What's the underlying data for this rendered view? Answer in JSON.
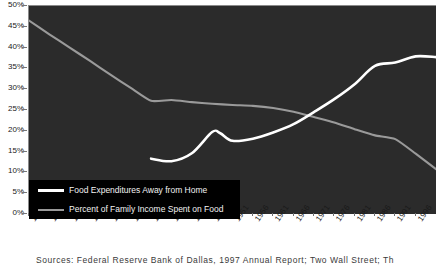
{
  "chart_data": {
    "type": "line",
    "title": "",
    "xlabel": "",
    "ylabel": "",
    "xlim": [
      1901,
      2001
    ],
    "ylim": [
      0,
      50
    ],
    "grid": false,
    "legend_position": "lower-left-inside",
    "y_tick_labels": [
      "50%",
      "45%",
      "40%",
      "35%",
      "30%",
      "25%",
      "20%",
      "15%",
      "10%",
      "5%",
      "0%"
    ],
    "y_tick_values": [
      50,
      45,
      40,
      35,
      30,
      25,
      20,
      15,
      10,
      5,
      0
    ],
    "x_tick_labels": [
      "1901",
      "1906",
      "1911",
      "1916",
      "1921",
      "1926",
      "1931",
      "1936",
      "1941",
      "1946",
      "1951",
      "1956",
      "1961",
      "1966",
      "1971",
      "1976",
      "1981",
      "1986",
      "1991",
      "1996"
    ],
    "x_tick_values": [
      1901,
      1906,
      1911,
      1916,
      1921,
      1926,
      1931,
      1936,
      1941,
      1946,
      1951,
      1956,
      1961,
      1966,
      1971,
      1976,
      1981,
      1986,
      1991,
      1996
    ],
    "series": [
      {
        "name": "Food Expenditures Away from Home",
        "color": "#ffffff",
        "x": [
          1931,
          1936,
          1941,
          1946,
          1948,
          1951,
          1956,
          1961,
          1966,
          1971,
          1976,
          1981,
          1986,
          1991,
          1996,
          2001
        ],
        "values": [
          13.3,
          12.7,
          14.6,
          19.7,
          19.4,
          17.6,
          18.1,
          19.6,
          21.6,
          24.5,
          27.6,
          31.2,
          35.6,
          36.4,
          37.9,
          37.7
        ]
      },
      {
        "name": "Percent of Family Income Spent on Food",
        "color": "#9a9a9a",
        "x": [
          1901,
          1906,
          1911,
          1916,
          1921,
          1926,
          1931,
          1936,
          1941,
          1946,
          1951,
          1956,
          1961,
          1966,
          1971,
          1976,
          1981,
          1986,
          1991,
          1996,
          2001
        ],
        "values": [
          46.5,
          43.2,
          40.0,
          36.8,
          33.5,
          30.3,
          27.2,
          27.4,
          26.9,
          26.5,
          26.2,
          26.0,
          25.5,
          24.6,
          23.3,
          22.0,
          20.4,
          18.9,
          18.0,
          14.5,
          10.8
        ]
      }
    ],
    "annotations": {
      "crossover_year": 1969,
      "crossover_value": 23.8
    }
  },
  "legend": {
    "items": [
      {
        "label": "Food Expenditures Away from Home",
        "swatch": "away"
      },
      {
        "label": "Percent of Family Income Spent on Food",
        "swatch": "income"
      }
    ]
  },
  "source": {
    "text": "Sources: Federal Reserve Bank of Dallas, 1997 Annual Report; Two Wall Street; Th"
  },
  "colors": {
    "panel_background": "#2b2b2b",
    "page_background": "#ffffff",
    "series_away_from_home": "#ffffff",
    "series_family_income": "#9a9a9a",
    "axis_text": "#1a1a1a",
    "legend_background": "#000000"
  }
}
